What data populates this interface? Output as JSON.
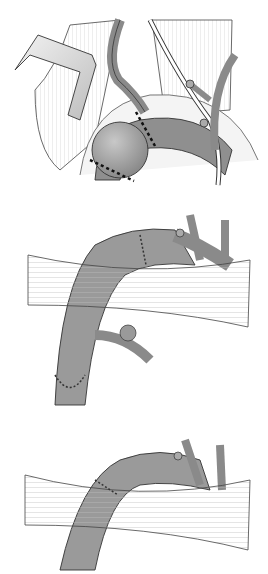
{
  "figure": {
    "panels": [
      {
        "id": "panel-1",
        "description": "Exposure of aortic arch aneurysm with retractor and dotted resection lines"
      },
      {
        "id": "panel-2",
        "description": "Interposition graft sutured to arch with vessel reimplantation"
      },
      {
        "id": "panel-3",
        "description": "Completed repair with single anastomosis beneath strap tissue"
      }
    ],
    "colors": {
      "vessel": "#9a9a9a",
      "vessel_dark": "#7c7c7c",
      "muscle": "#d6d6d6",
      "outline": "#3a3a3a",
      "background": "#ffffff"
    }
  }
}
